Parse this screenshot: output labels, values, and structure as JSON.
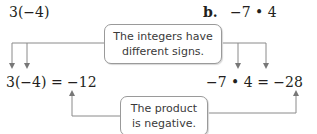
{
  "part_a": {
    "expression": "3(−4)",
    "result_equation": "3(−4) = −12"
  },
  "part_b": {
    "label": "b.",
    "expression": "−7 • 4",
    "result_equation": "−7 • 4 = −28"
  },
  "callouts": {
    "top": {
      "line1": "The integers have",
      "line2": "different signs."
    },
    "bottom": {
      "line1": "The product",
      "line2": "is negative."
    }
  },
  "colors": {
    "line": "#8a8a8a",
    "text": "#231f20",
    "callout_border": "#9a9a9a"
  }
}
